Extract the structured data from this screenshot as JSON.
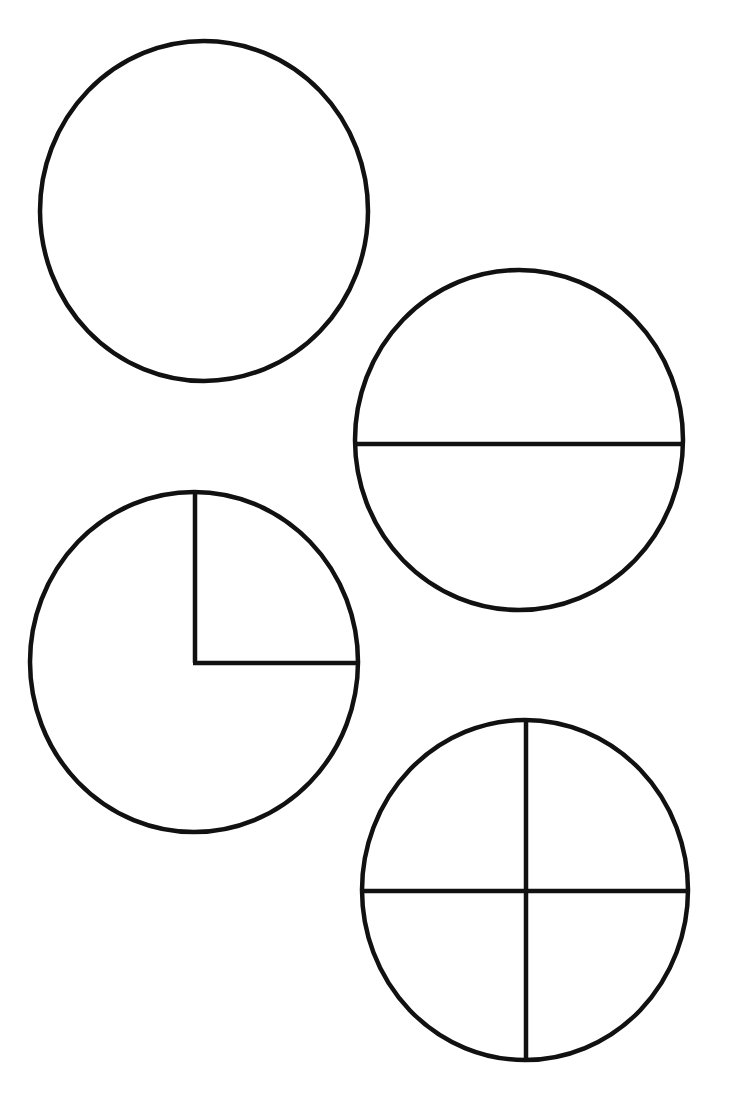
{
  "diagram": {
    "stroke_color": "#111111",
    "background": "#ffffff",
    "shapes": [
      {
        "id": "whole",
        "label": "whole circle",
        "parts": 1,
        "cx": 204,
        "cy": 211,
        "rx": 164,
        "ry": 170,
        "dividers": []
      },
      {
        "id": "halves",
        "label": "circle divided into halves",
        "parts": 2,
        "cx": 519,
        "cy": 440,
        "rx": 164,
        "ry": 170,
        "dividers": [
          {
            "x1": 355,
            "y1": 444,
            "x2": 683,
            "y2": 444
          }
        ]
      },
      {
        "id": "quarter-marked",
        "label": "circle with one quarter marked",
        "parts": 4,
        "shaded_or_marked": "top-right quarter",
        "cx": 194,
        "cy": 662,
        "rx": 164,
        "ry": 170,
        "dividers": [
          {
            "x1": 195,
            "y1": 493,
            "x2": 195,
            "y2": 663
          },
          {
            "x1": 193,
            "y1": 663,
            "x2": 358,
            "y2": 663
          }
        ]
      },
      {
        "id": "quarters",
        "label": "circle divided into quarters",
        "parts": 4,
        "cx": 525,
        "cy": 890,
        "rx": 163,
        "ry": 170,
        "dividers": [
          {
            "x1": 526,
            "y1": 720,
            "x2": 526,
            "y2": 1060
          },
          {
            "x1": 362,
            "y1": 891,
            "x2": 688,
            "y2": 891
          }
        ]
      }
    ]
  }
}
